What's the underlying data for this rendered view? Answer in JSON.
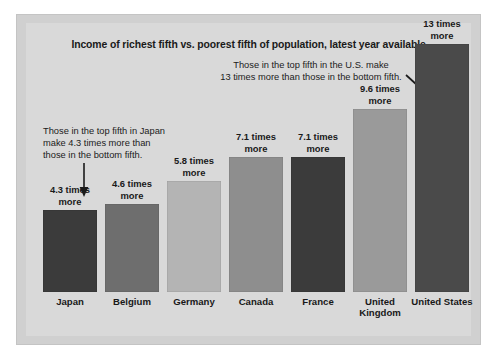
{
  "figure": {
    "title": "Income of richest fifth vs. poorest fifth of population, latest year available",
    "annotation_us": "Those in the top fifth in the U.S. make\n13 times more than those in the bottom fifth.",
    "annotation_japan": "Those in the top fifth in Japan\nmake 4.3 times more than\nthose in the bottom fifth.",
    "background_color": "#d9d9d9",
    "plate_color": "#d0d0d0"
  },
  "chart_data": {
    "type": "bar",
    "title": "Income of richest fifth vs. poorest fifth of population, latest year available",
    "xlabel": "",
    "ylabel": "",
    "ylim": [
      0,
      13
    ],
    "grid": false,
    "legend": "none",
    "categories": [
      "Japan",
      "Belgium",
      "Germany",
      "Canada",
      "France",
      "United Kingdom",
      "United States"
    ],
    "values": [
      4.3,
      4.6,
      5.8,
      7.1,
      7.1,
      9.6,
      13
    ],
    "value_labels": [
      "4.3 times\nmore",
      "4.6 times\nmore",
      "5.8 times\nmore",
      "7.1 times\nmore",
      "7.1 times\nmore",
      "9.6 times\nmore",
      "13 times\nmore"
    ],
    "bar_colors": [
      "#3b3b3b",
      "#6e6e6e",
      "#b4b4b4",
      "#8e8e8e",
      "#3b3b3b",
      "#9a9a9a",
      "#4a4a4a"
    ],
    "annotations": [
      {
        "text": "Those in the top fifth in Japan make 4.3 times more than those in the bottom fifth.",
        "target": "Japan",
        "arrow": "down"
      },
      {
        "text": "Those in the top fifth in the U.S. make 13 times more than those in the bottom fifth.",
        "target": "United States",
        "arrow": "diagonal-down-right"
      }
    ]
  },
  "bars": [
    {
      "label": "Japan",
      "value_label": "4.3 times\nmore",
      "value": 4.3,
      "color": "#3b3b3b"
    },
    {
      "label": "Belgium",
      "value_label": "4.6 times\nmore",
      "value": 4.6,
      "color": "#6e6e6e"
    },
    {
      "label": "Germany",
      "value_label": "5.8 times\nmore",
      "value": 5.8,
      "color": "#b4b4b4"
    },
    {
      "label": "Canada",
      "value_label": "7.1 times\nmore",
      "value": 7.1,
      "color": "#8e8e8e"
    },
    {
      "label": "France",
      "value_label": "7.1 times\nmore",
      "value": 7.1,
      "color": "#3b3b3b"
    },
    {
      "label": "United Kingdom",
      "value_label": "9.6 times\nmore",
      "value": 9.6,
      "color": "#9a9a9a"
    },
    {
      "label": "United States",
      "value_label": "13 times\nmore",
      "value": 13.0,
      "color": "#4a4a4a"
    }
  ]
}
